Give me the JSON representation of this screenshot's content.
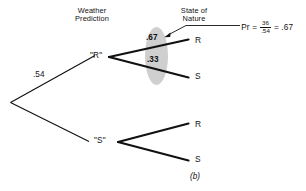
{
  "figure": {
    "caption": "(b)",
    "column_headers": [
      {
        "id": "weather-prediction",
        "line1": "Weather",
        "line2": "Prediction"
      },
      {
        "id": "state-of-nature",
        "line1": "State of",
        "line2": "Nature"
      }
    ],
    "nodes": [
      {
        "id": "prediction-r",
        "label": "\"R\""
      },
      {
        "id": "prediction-s",
        "label": "\"S\""
      }
    ],
    "leaves": [
      {
        "id": "leaf-r-upper",
        "label": "R"
      },
      {
        "id": "leaf-s-upper",
        "label": "S"
      },
      {
        "id": "leaf-r-lower",
        "label": "R"
      },
      {
        "id": "leaf-s-lower",
        "label": "S"
      }
    ],
    "edge_labels": [
      {
        "id": "root-upper-prob",
        "value": ".54"
      },
      {
        "id": "branch-r-to-r-prob",
        "value": ".67"
      },
      {
        "id": "branch-r-to-s-prob",
        "value": ".33"
      }
    ],
    "annotation": {
      "pr_symbol": "Pr",
      "equals_1": "=",
      "numerator": "36",
      "denominator": ".54",
      "equals_2": "=",
      "result": ".67"
    },
    "colors": {
      "line": "#111111",
      "highlight_ellipse": "#cfcfcf",
      "background": "#ffffff"
    }
  }
}
